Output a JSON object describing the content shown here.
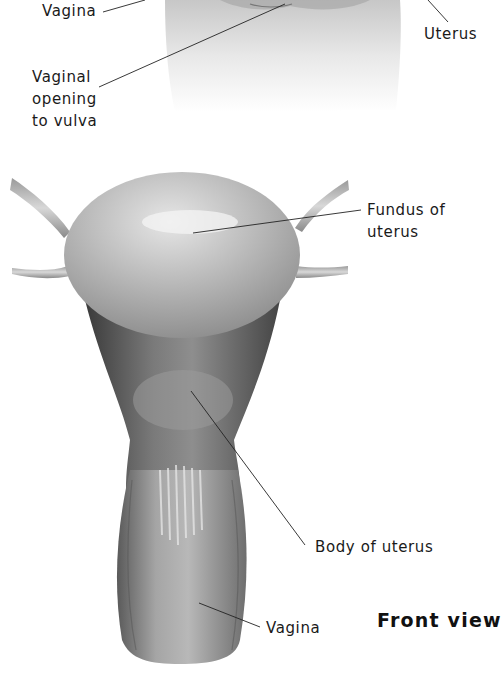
{
  "figure": {
    "view_title": "Front view",
    "top_panel": {
      "labels": {
        "vagina": "Vagina",
        "uterus": "Uterus",
        "vaginal_opening": [
          "Vaginal",
          "opening",
          "to vulva"
        ]
      }
    },
    "bottom_panel": {
      "labels": {
        "fundus": [
          "Fundus of",
          "uterus"
        ],
        "body": "Body of uterus",
        "vagina": "Vagina"
      }
    },
    "colors": {
      "background": "#ffffff",
      "label_text": "#1a1a1a",
      "leader_line": "#222222",
      "tissue_light": "#cfcfcf",
      "tissue_mid": "#9a9a9a",
      "tissue_dark": "#3c3c3c"
    }
  }
}
